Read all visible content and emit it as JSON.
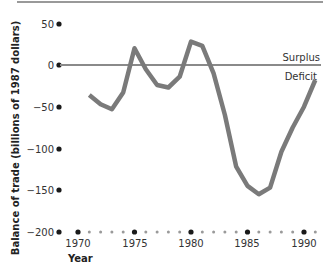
{
  "chart_data": {
    "type": "line",
    "title": "",
    "xlabel": "Year",
    "ylabel": "Balance of trade (billions of 1987 dollars)",
    "xlim": [
      1970,
      1991
    ],
    "ylim": [
      -200,
      50
    ],
    "x_ticks": [
      1970,
      1975,
      1980,
      1985,
      1990
    ],
    "y_ticks": [
      50,
      0,
      -50,
      -100,
      -150,
      -200
    ],
    "grid": false,
    "annotations": [
      {
        "text": "Surplus",
        "x": 1991,
        "y": 4
      },
      {
        "text": "Deficit",
        "x": 1991,
        "y": -8
      }
    ],
    "reference_line": {
      "y": 0,
      "label": "zero balance"
    },
    "series": [
      {
        "name": "Balance of trade",
        "color": "#7a7a7a",
        "x": [
          1971,
          1972,
          1973,
          1974,
          1975,
          1976,
          1977,
          1978,
          1979,
          1980,
          1981,
          1982,
          1983,
          1984,
          1985,
          1986,
          1987,
          1988,
          1989,
          1990,
          1991
        ],
        "values": [
          -36,
          -47,
          -53,
          -33,
          20,
          -5,
          -24,
          -27,
          -14,
          28,
          23,
          -10,
          -60,
          -122,
          -145,
          -155,
          -147,
          -104,
          -75,
          -50,
          -18
        ]
      }
    ]
  },
  "labels": {
    "ylabel": "Balance of trade (billions of 1987 dollars)",
    "xlabel": "Year",
    "surplus": "Surplus",
    "deficit": "Deficit",
    "y_ticks": [
      "50",
      "0",
      "−50",
      "−100",
      "−150",
      "−200"
    ],
    "x_ticks": [
      "1970",
      "1975",
      "1980",
      "1985",
      "1990"
    ]
  },
  "colors": {
    "line": "#7a7a7a",
    "zero_line": "#8a8a8a",
    "dots_major": "#1a1a1a",
    "dots_minor": "#9a9a9a",
    "top_rule": "#777777"
  }
}
